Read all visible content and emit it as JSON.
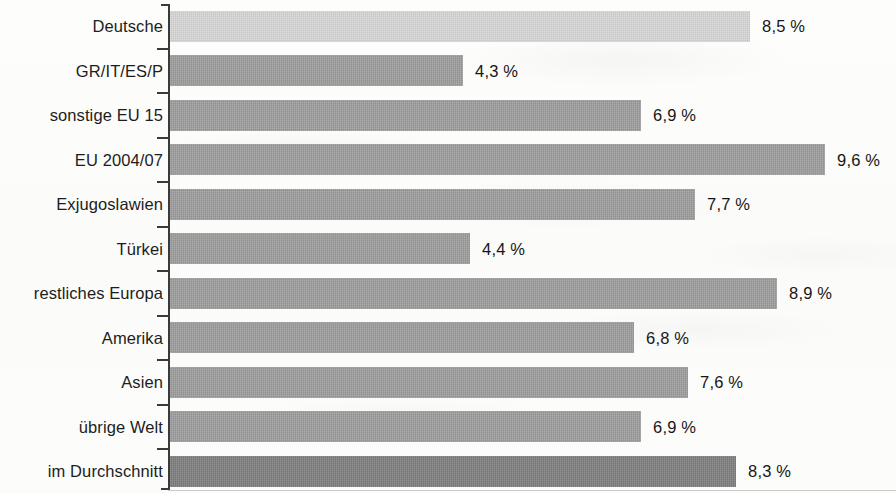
{
  "chart_data": {
    "type": "bar",
    "orientation": "horizontal",
    "title": "",
    "subtitle": "",
    "xlabel": "",
    "ylabel": "",
    "unit": "%",
    "decimal_separator": ",",
    "xlim": [
      0,
      10.6
    ],
    "grid": false,
    "legend": null,
    "categories": [
      "Deutsche",
      "GR/IT/ES/P",
      "sonstige EU 15",
      "EU 2004/07",
      "Exjugoslawien",
      "Türkei",
      "restliches Europa",
      "Amerika",
      "Asien",
      "übrige Welt",
      "im Durchschnitt"
    ],
    "values": [
      8.5,
      4.3,
      6.9,
      9.6,
      7.7,
      4.4,
      8.9,
      6.8,
      7.6,
      6.9,
      8.3
    ],
    "value_labels": [
      "8,5 %",
      "4,3 %",
      "6,9 %",
      "9,6 %",
      "7,7 %",
      "4,4 %",
      "8,9 %",
      "6,8 %",
      "7,6 %",
      "6,9 %",
      "8,3 %"
    ],
    "bar_styles": [
      "light",
      "normal",
      "normal",
      "normal",
      "normal",
      "normal",
      "normal",
      "normal",
      "normal",
      "normal",
      "dark"
    ],
    "colors": {
      "bar_light": "#d6d6d6",
      "bar_normal": "#9c9c9c",
      "bar_dark": "#7e7e7e",
      "axis": "#3a3a3a",
      "text": "#1d1d1d",
      "background": "#fdfdfb"
    }
  }
}
